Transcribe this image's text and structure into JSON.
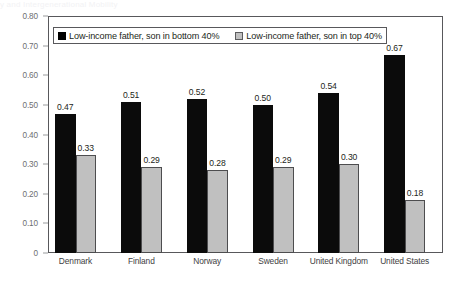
{
  "figure": {
    "cut_off_title": "y and Intergenerational Mobility"
  },
  "chart_data": {
    "type": "bar",
    "title": "",
    "subtitle": "",
    "xlabel": "",
    "ylabel": "",
    "categories": [
      "Denmark",
      "Finland",
      "Norway",
      "Sweden",
      "United Kingdom",
      "United States"
    ],
    "series": [
      {
        "name": "Low-income father, son in bottom 40%",
        "color": "#0b0b0b",
        "values": [
          0.47,
          0.51,
          0.52,
          0.5,
          0.54,
          0.67
        ],
        "labels": [
          "0.47",
          "0.51",
          "0.52",
          "0.50",
          "0.54",
          "0.67"
        ]
      },
      {
        "name": "Low-income father, son in top 40%",
        "color": "#c0c0c0",
        "values": [
          0.33,
          0.29,
          0.28,
          0.29,
          0.3,
          0.18
        ],
        "labels": [
          "0.33",
          "0.29",
          "0.28",
          "0.29",
          "0.30",
          "0.18"
        ]
      }
    ],
    "ylim": [
      0,
      0.8
    ],
    "ytick_values": [
      0.8,
      0.7,
      0.6,
      0.5,
      0.4,
      0.3,
      0.2,
      0.1,
      0
    ],
    "ytick_labels": [
      "0.80",
      "0.70",
      "0.60",
      "0.50",
      "0.40",
      "0.30",
      "0.20",
      "0.10",
      "0"
    ],
    "grid": false,
    "legend_position": "top-inside"
  }
}
